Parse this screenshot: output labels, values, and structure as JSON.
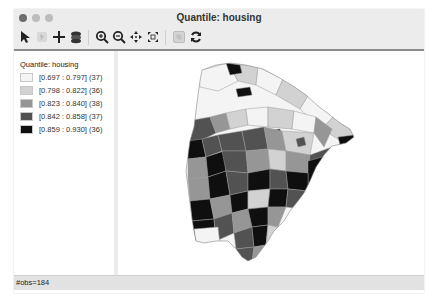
{
  "window": {
    "title": "Quantile: housing",
    "traffic_lights": [
      "close",
      "minimize",
      "zoom"
    ]
  },
  "toolbar": {
    "items": [
      {
        "name": "select-tool",
        "icon": "pointer-arrow-icon"
      },
      {
        "name": "selection-shape-tool",
        "icon": "selection-icon"
      },
      {
        "name": "add-tool",
        "icon": "plus-icon"
      },
      {
        "name": "layers-tool",
        "icon": "layers-icon"
      },
      {
        "name": "zoom-in-tool",
        "icon": "zoom-in-icon"
      },
      {
        "name": "zoom-out-tool",
        "icon": "zoom-out-icon"
      },
      {
        "name": "pan-tool",
        "icon": "pan-icon"
      },
      {
        "name": "full-extent-tool",
        "icon": "full-extent-icon"
      },
      {
        "name": "basemap-tool",
        "icon": "basemap-icon"
      },
      {
        "name": "refresh-tool",
        "icon": "refresh-icon"
      }
    ]
  },
  "legend": {
    "title": "Quantile: housing",
    "items": [
      {
        "label": "[0.697 : 0.797] (37)",
        "color": "#f4f4f4"
      },
      {
        "label": "[0.798 : 0.822] (36)",
        "color": "#d2d2d2"
      },
      {
        "label": "[0.823 : 0.840] (38)",
        "color": "#969696"
      },
      {
        "label": "[0.842 : 0.858] (37)",
        "color": "#525252"
      },
      {
        "label": "[0.859 : 0.930] (36)",
        "color": "#0f0f0f"
      }
    ]
  },
  "map": {
    "region_count": 184,
    "classification": "Quantile",
    "variable": "housing"
  },
  "status": {
    "text": "#obs=184"
  }
}
